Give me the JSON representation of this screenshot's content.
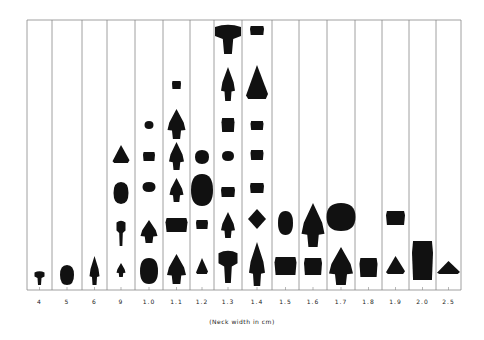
{
  "chart_data": {
    "type": "bar",
    "title": "",
    "xlabel": "(Neck width in cm)",
    "ylabel": "",
    "categories": [
      "4",
      "5",
      "6",
      "9",
      "1.0",
      "1.1",
      "1.2",
      "1.3",
      "1.4",
      "1.5",
      "1.6",
      "1.7",
      "1.8",
      "1.9",
      "2.0",
      "2.5"
    ],
    "values": [
      1,
      1,
      1,
      4,
      6,
      7,
      4,
      9,
      9,
      2,
      2,
      2,
      1,
      2,
      1,
      1
    ],
    "legend": [],
    "grid": "vertical column dividers",
    "note": "Pictograph histogram: each count is an artifact (projectile point) silhouette stacked in its column"
  },
  "axis": {
    "left": 27,
    "right": 461,
    "top": 20,
    "baseline": 290,
    "column_edges": [
      27,
      52,
      82,
      107,
      135,
      163,
      190,
      214,
      242,
      272,
      299,
      327,
      355,
      382,
      409,
      436,
      461
    ]
  },
  "colors": {
    "line": "#888888",
    "ink": "#111111",
    "background": "#ffffff"
  },
  "artifacts": [
    {
      "col": 0,
      "y": 271,
      "w": 10,
      "h": 14,
      "shape": "stem"
    },
    {
      "col": 1,
      "y": 265,
      "w": 14,
      "h": 20,
      "shape": "blob"
    },
    {
      "col": 2,
      "y": 256,
      "w": 10,
      "h": 29,
      "shape": "point"
    },
    {
      "col": 3,
      "y": 263,
      "w": 9,
      "h": 14,
      "shape": "point"
    },
    {
      "col": 3,
      "y": 220,
      "w": 9,
      "h": 26,
      "shape": "stem"
    },
    {
      "col": 3,
      "y": 182,
      "w": 15,
      "h": 22,
      "shape": "blob"
    },
    {
      "col": 3,
      "y": 145,
      "w": 17,
      "h": 18,
      "shape": "triangle"
    },
    {
      "col": 4,
      "y": 258,
      "w": 18,
      "h": 26,
      "shape": "blob"
    },
    {
      "col": 4,
      "y": 220,
      "w": 17,
      "h": 23,
      "shape": "point"
    },
    {
      "col": 4,
      "y": 182,
      "w": 13,
      "h": 10,
      "shape": "blob"
    },
    {
      "col": 4,
      "y": 152,
      "w": 12,
      "h": 9,
      "shape": "block"
    },
    {
      "col": 4,
      "y": 121,
      "w": 9,
      "h": 8,
      "shape": "blob"
    },
    {
      "col": 5,
      "y": 254,
      "w": 19,
      "h": 30,
      "shape": "point"
    },
    {
      "col": 5,
      "y": 218,
      "w": 22,
      "h": 14,
      "shape": "block"
    },
    {
      "col": 5,
      "y": 178,
      "w": 14,
      "h": 24,
      "shape": "point"
    },
    {
      "col": 5,
      "y": 142,
      "w": 15,
      "h": 28,
      "shape": "point"
    },
    {
      "col": 5,
      "y": 109,
      "w": 18,
      "h": 30,
      "shape": "point"
    },
    {
      "col": 5,
      "y": 81,
      "w": 9,
      "h": 8,
      "shape": "block"
    },
    {
      "col": 6,
      "y": 258,
      "w": 12,
      "h": 16,
      "shape": "triangle"
    },
    {
      "col": 6,
      "y": 220,
      "w": 12,
      "h": 9,
      "shape": "block"
    },
    {
      "col": 6,
      "y": 174,
      "w": 22,
      "h": 32,
      "shape": "blob"
    },
    {
      "col": 6,
      "y": 150,
      "w": 14,
      "h": 14,
      "shape": "blob"
    },
    {
      "col": 7,
      "y": 250,
      "w": 19,
      "h": 33,
      "shape": "stem"
    },
    {
      "col": 7,
      "y": 212,
      "w": 14,
      "h": 26,
      "shape": "point"
    },
    {
      "col": 7,
      "y": 187,
      "w": 14,
      "h": 10,
      "shape": "block"
    },
    {
      "col": 7,
      "y": 151,
      "w": 12,
      "h": 10,
      "shape": "blob"
    },
    {
      "col": 7,
      "y": 118,
      "w": 13,
      "h": 14,
      "shape": "block"
    },
    {
      "col": 7,
      "y": 67,
      "w": 14,
      "h": 34,
      "shape": "point"
    },
    {
      "col": 7,
      "y": 24,
      "w": 26,
      "h": 30,
      "shape": "stem"
    },
    {
      "col": 8,
      "y": 242,
      "w": 16,
      "h": 44,
      "shape": "point"
    },
    {
      "col": 8,
      "y": 209,
      "w": 18,
      "h": 20,
      "shape": "diamond"
    },
    {
      "col": 8,
      "y": 183,
      "w": 14,
      "h": 10,
      "shape": "block"
    },
    {
      "col": 8,
      "y": 150,
      "w": 13,
      "h": 10,
      "shape": "block"
    },
    {
      "col": 8,
      "y": 121,
      "w": 13,
      "h": 9,
      "shape": "block"
    },
    {
      "col": 8,
      "y": 65,
      "w": 22,
      "h": 34,
      "shape": "triangle"
    },
    {
      "col": 8,
      "y": 26,
      "w": 14,
      "h": 9,
      "shape": "block"
    },
    {
      "col": 9,
      "y": 257,
      "w": 22,
      "h": 18,
      "shape": "block"
    },
    {
      "col": 9,
      "y": 211,
      "w": 15,
      "h": 24,
      "shape": "blob"
    },
    {
      "col": 10,
      "y": 258,
      "w": 18,
      "h": 17,
      "shape": "block"
    },
    {
      "col": 10,
      "y": 203,
      "w": 23,
      "h": 44,
      "shape": "point"
    },
    {
      "col": 11,
      "y": 247,
      "w": 24,
      "h": 38,
      "shape": "point"
    },
    {
      "col": 11,
      "y": 203,
      "w": 29,
      "h": 28,
      "shape": "blob"
    },
    {
      "col": 12,
      "y": 258,
      "w": 18,
      "h": 19,
      "shape": "block"
    },
    {
      "col": 13,
      "y": 256,
      "w": 19,
      "h": 18,
      "shape": "triangle"
    },
    {
      "col": 13,
      "y": 211,
      "w": 19,
      "h": 14,
      "shape": "block"
    },
    {
      "col": 14,
      "y": 241,
      "w": 21,
      "h": 39,
      "shape": "block"
    },
    {
      "col": 15,
      "y": 261,
      "w": 23,
      "h": 13,
      "shape": "triangle"
    }
  ]
}
